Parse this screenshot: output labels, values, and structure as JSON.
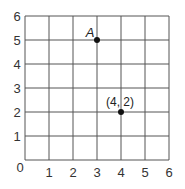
{
  "grid": {
    "x_ticks": [
      "0",
      "1",
      "2",
      "3",
      "4",
      "5",
      "6"
    ],
    "y_ticks": [
      "1",
      "2",
      "3",
      "4",
      "5",
      "6"
    ],
    "xmin": 0,
    "xmax": 6,
    "ymin": 0,
    "ymax": 6,
    "line_color": "#555555"
  },
  "points": [
    {
      "label": "A",
      "x": 3,
      "y": 5
    },
    {
      "label": "(4, 2)",
      "x": 4,
      "y": 2
    }
  ],
  "chart_data": {
    "type": "scatter",
    "title": "",
    "xlabel": "",
    "ylabel": "",
    "xlim": [
      0,
      6
    ],
    "ylim": [
      0,
      6
    ],
    "grid": true,
    "x_tick_labels": [
      "0",
      "1",
      "2",
      "3",
      "4",
      "5",
      "6"
    ],
    "y_tick_labels": [
      "1",
      "2",
      "3",
      "4",
      "5",
      "6"
    ],
    "series": [
      {
        "name": "points",
        "x": [
          3,
          4
        ],
        "y": [
          5,
          2
        ],
        "labels": [
          "A",
          "(4, 2)"
        ]
      }
    ]
  }
}
